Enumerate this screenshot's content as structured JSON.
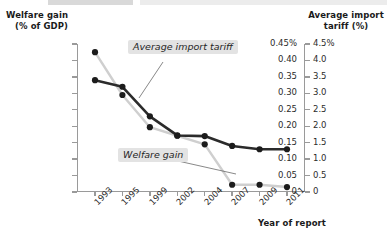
{
  "chart_data": {
    "type": "line",
    "title": "",
    "xlabel": "Year of report",
    "categories": [
      "1993",
      "1995",
      "1999",
      "2002",
      "2004",
      "2007",
      "2009",
      "2011"
    ],
    "grid": false,
    "legend_position": "inline-callouts",
    "axes": {
      "left": {
        "label_line1": "Welfare gain",
        "label_line2": "(% of GDP)",
        "ylim": [
          0,
          0.45
        ],
        "ticks": [
          "0.45%",
          "0.40",
          "0.35",
          "0.30",
          "0.25",
          "0.20",
          "0.15",
          "0.10",
          "0.05",
          "0"
        ],
        "tick_values": [
          0.45,
          0.4,
          0.35,
          0.3,
          0.25,
          0.2,
          0.15,
          0.1,
          0.05,
          0
        ]
      },
      "right": {
        "label_line1": "Average import",
        "label_line2": "tariff (%)",
        "ylim": [
          0,
          4.5
        ],
        "ticks": [
          "4.5%",
          "4.0",
          "3.5",
          "3.0",
          "2.5",
          "2.0",
          "1.5",
          "1.0",
          "0.5",
          "0"
        ],
        "tick_values": [
          4.5,
          4.0,
          3.5,
          3.0,
          2.5,
          2.0,
          1.5,
          1.0,
          0.5,
          0
        ]
      }
    },
    "series": [
      {
        "name": "Average import tariff",
        "axis": "right",
        "color": "#2b2b2b",
        "values": [
          3.4,
          3.2,
          2.3,
          1.72,
          1.7,
          1.4,
          1.3,
          1.3
        ]
      },
      {
        "name": "Welfare gain",
        "axis": "left",
        "color": "#cfcfcf",
        "values": [
          0.425,
          0.295,
          0.197,
          0.171,
          0.145,
          0.022,
          0.022,
          0.015
        ]
      }
    ],
    "annotations": [
      {
        "text": "Average import tariff",
        "target_series": "Average import tariff"
      },
      {
        "text": "Welfare gain",
        "target_series": "Welfare gain"
      }
    ]
  }
}
